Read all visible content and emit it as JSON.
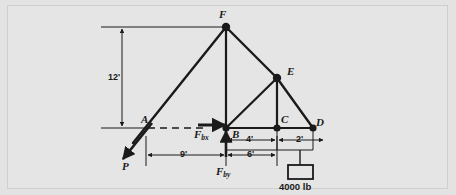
{
  "figure": {
    "type": "free-body-diagram",
    "background_color": "#e3e3e3",
    "frame_color": "#cfcfcf",
    "line_color": "#1a1a1a"
  },
  "nodes": [
    {
      "id": "A",
      "label": "A",
      "x": 148,
      "y": 128,
      "joint": false
    },
    {
      "id": "B",
      "label": "B",
      "x": 226,
      "y": 128,
      "joint": true
    },
    {
      "id": "C",
      "label": "C",
      "x": 277,
      "y": 128,
      "joint": true
    },
    {
      "id": "D",
      "label": "D",
      "x": 313,
      "y": 128,
      "joint": true
    },
    {
      "id": "E",
      "label": "E",
      "x": 277,
      "y": 78,
      "joint": true
    },
    {
      "id": "F",
      "label": "F",
      "x": 226,
      "y": 27,
      "joint": true
    }
  ],
  "members": [
    {
      "from": "A",
      "to": "F"
    },
    {
      "from": "F",
      "to": "B"
    },
    {
      "from": "F",
      "to": "E"
    },
    {
      "from": "B",
      "to": "E"
    },
    {
      "from": "E",
      "to": "C"
    },
    {
      "from": "E",
      "to": "D"
    },
    {
      "from": "B",
      "to": "D"
    }
  ],
  "forces": [
    {
      "id": "P",
      "label": "P",
      "direction": "down-left",
      "applied_at": "A",
      "tip_x": 121,
      "tip_y": 160
    },
    {
      "id": "Fbx",
      "label_main": "F",
      "label_sub": "bx",
      "direction": "right",
      "applied_at": "B"
    },
    {
      "id": "Fby",
      "label_main": "F",
      "label_sub": "by",
      "direction": "up",
      "applied_at": "B"
    }
  ],
  "dimensions": [
    {
      "id": "height",
      "value": "12'",
      "orientation": "vertical",
      "from": "baseline",
      "to": "F-level"
    },
    {
      "id": "span-AB",
      "value": "9'",
      "orientation": "horizontal",
      "from": "A",
      "to": "B"
    },
    {
      "id": "span-BC",
      "value": "6'",
      "orientation": "horizontal",
      "from": "B",
      "to": "C"
    },
    {
      "id": "span-CD-left",
      "value": "4'",
      "orientation": "horizontal",
      "from": "B",
      "to": "C"
    },
    {
      "id": "span-CD-right",
      "value": "2'",
      "orientation": "horizontal",
      "from": "C",
      "to": "D"
    }
  ],
  "load": {
    "label": "4000 lb",
    "block_x": 290,
    "block_y": 164
  }
}
